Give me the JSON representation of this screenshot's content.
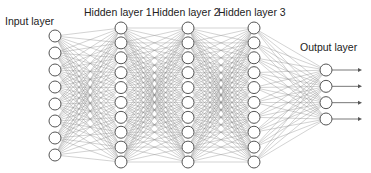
{
  "colors": {
    "edge": "#8a8a8a",
    "node_stroke": "#555555",
    "node_fill": "#ffffff",
    "text": "#222222",
    "arrow": "#555555"
  },
  "layers": [
    {
      "name": "input",
      "label": "Input layer",
      "nodes": 8,
      "x": 55,
      "y_top": 36,
      "y_bottom": 155,
      "label_x": 5,
      "label_y": 16
    },
    {
      "name": "hidden1",
      "label": "Hidden layer 1",
      "nodes": 10,
      "x": 121,
      "y_top": 28,
      "y_bottom": 162,
      "label_x": 84,
      "label_y": 7
    },
    {
      "name": "hidden2",
      "label": "Hidden layer 2",
      "nodes": 10,
      "x": 188,
      "y_top": 28,
      "y_bottom": 162,
      "label_x": 152,
      "label_y": 7
    },
    {
      "name": "hidden3",
      "label": "Hidden layer 3",
      "nodes": 10,
      "x": 254,
      "y_top": 28,
      "y_bottom": 162,
      "label_x": 218,
      "label_y": 7
    },
    {
      "name": "output",
      "label": "Output layer",
      "nodes": 4,
      "x": 326,
      "y_top": 70,
      "y_bottom": 119,
      "label_x": 300,
      "label_y": 42
    }
  ],
  "node_radius": 6,
  "output_arrows": {
    "length": 30,
    "count": 4
  }
}
